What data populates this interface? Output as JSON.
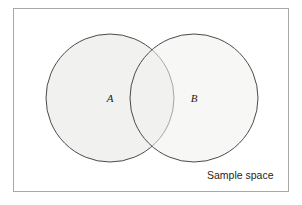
{
  "figure": {
    "kind": "venn-diagram",
    "title_label": "Sample space",
    "sets": [
      {
        "id": "A",
        "label": "A",
        "cx": 110,
        "cy": 98,
        "r": 64
      },
      {
        "id": "B",
        "label": "B",
        "cx": 194,
        "cy": 98,
        "r": 64
      }
    ],
    "colors": {
      "circle_fill": "#f1f1ef",
      "circle_stroke": "#4a4a4a",
      "frame_stroke": "#a8a8a8",
      "background": "#ffffff",
      "text": "#1a1a1a"
    },
    "frame": {
      "x": 13,
      "y": 8,
      "width": 276,
      "height": 184
    }
  }
}
